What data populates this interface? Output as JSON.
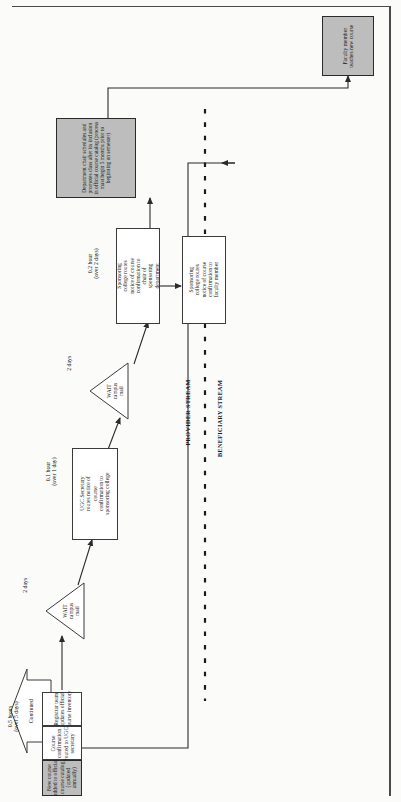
{
  "diagram": {
    "stream_labels": {
      "provider": "PROVIDER STREAM",
      "beneficiary": "BENEFICIARY STREAM"
    },
    "continued_marker": "Continued",
    "durations": [
      {
        "id": "d1",
        "line1": "0.5 hours",
        "line2": "(over 5 days)"
      },
      {
        "id": "d2",
        "line1": "2 days",
        "line2": ""
      },
      {
        "id": "d3",
        "line1": "0.1 hour",
        "line2": "(over 1 day)"
      },
      {
        "id": "d4",
        "line1": "2 days",
        "line2": ""
      },
      {
        "id": "d5",
        "line1": "0.2 hour",
        "line2": "(over 2 days)"
      }
    ],
    "boxes": [
      {
        "id": "registrar",
        "text": "Registrar team updates official course inventory",
        "shaded": false
      },
      {
        "id": "course-confirmation",
        "text": "Course confirmation routed to UGC secretary",
        "shaded": false
      },
      {
        "id": "new-course-added",
        "text": "New course added to official course catalog (updated annually)",
        "shaded": true
      },
      {
        "id": "ugc-secretary",
        "text": "UGC Secretary routes notice of course confirmation to sponsoring college",
        "shaded": false
      },
      {
        "id": "college-to-chair",
        "text": "Sponsoring college routes notice of course confirmation to chair of sponsoring department",
        "shaded": false
      },
      {
        "id": "college-to-faculty",
        "text": "Sponsoring college routes notice of course confirmation to faculty member",
        "shaded": false
      },
      {
        "id": "department-chair",
        "text": "Department chair schedules and promotes class after its inclusion in official course catalog (process must begin 5 months prior to beginning on semester)",
        "shaded": true
      },
      {
        "id": "faculty-teaches",
        "text": "Faculty member teaches new course",
        "shaded": true
      }
    ],
    "wait_nodes": [
      {
        "id": "wait1",
        "line1": "WAIT",
        "line2": "campus",
        "line3": "mail"
      },
      {
        "id": "wait2",
        "line1": "WAIT",
        "line2": "campus",
        "line3": "mail"
      }
    ],
    "colors": {
      "shaded_fill": "#bdbdbd",
      "box_stroke": "#3a3a3a",
      "connector": "#2b2b2b",
      "page_background": "#fbfbfa",
      "dotted_divider": "#1a1a1a"
    }
  }
}
